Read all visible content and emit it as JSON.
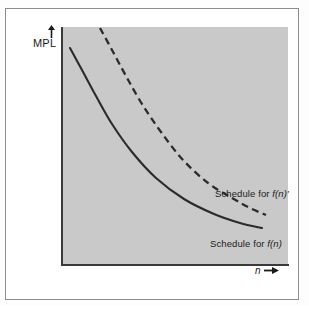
{
  "figure": {
    "axes": {
      "y_label": "MPL",
      "y_arrow_icon": "up-arrow-icon",
      "x_label": "n",
      "x_arrow_icon": "right-arrow-icon"
    },
    "annotations": {
      "upper_curve_label_prefix": "Schedule for ",
      "upper_curve_label_symbol": "f(n)",
      "upper_curve_label_prime": "′",
      "lower_curve_label_prefix": "Schedule for ",
      "lower_curve_label_symbol": "f(n)"
    },
    "colors": {
      "plot_background": "#c9c9c9",
      "page_background": "#ffffff",
      "frame_border": "#8d8d8d",
      "axis_line": "#3a3a3a",
      "curve_stroke": "#2b2b2b",
      "text": "#1a1a1a"
    }
  },
  "chart_data": {
    "type": "line",
    "title": "",
    "xlabel": "n",
    "ylabel": "MPL",
    "grid": false,
    "legend": "inline-annotations",
    "axis_ticks": {
      "x": [],
      "y": []
    },
    "series": [
      {
        "name": "Schedule for f(n)",
        "style": "solid",
        "label_position": "bottom-right",
        "points": [
          {
            "x": 70,
            "y": 48
          },
          {
            "x": 82,
            "y": 70
          },
          {
            "x": 96,
            "y": 96
          },
          {
            "x": 112,
            "y": 124
          },
          {
            "x": 132,
            "y": 152
          },
          {
            "x": 156,
            "y": 178
          },
          {
            "x": 184,
            "y": 199
          },
          {
            "x": 214,
            "y": 214
          },
          {
            "x": 240,
            "y": 223
          },
          {
            "x": 262,
            "y": 228
          }
        ]
      },
      {
        "name": "Schedule for f(n)'",
        "style": "dashed",
        "label_position": "middle-right",
        "points": [
          {
            "x": 100,
            "y": 28
          },
          {
            "x": 112,
            "y": 50
          },
          {
            "x": 126,
            "y": 76
          },
          {
            "x": 142,
            "y": 104
          },
          {
            "x": 161,
            "y": 132
          },
          {
            "x": 183,
            "y": 160
          },
          {
            "x": 208,
            "y": 183
          },
          {
            "x": 232,
            "y": 198
          },
          {
            "x": 250,
            "y": 208
          },
          {
            "x": 266,
            "y": 215
          }
        ]
      }
    ]
  }
}
